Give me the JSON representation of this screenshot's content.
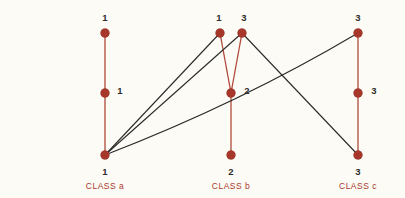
{
  "diagram": {
    "background_color": "#fdfbf5",
    "node_color": "#a8372b",
    "intra_class_line_color": "#b04a3c",
    "inter_class_line_color": "#2a2a2a",
    "label_text_color": "#2c2c2c",
    "class_label_color": "#a8372b"
  },
  "rows": [
    {
      "id": "read",
      "label": "READ:",
      "y": 33
    },
    {
      "id": "execute",
      "label": "EXECUTE:",
      "y": 93
    },
    {
      "id": "write",
      "label": "WRITE:",
      "y": 155
    }
  ],
  "classes": [
    {
      "id": "a",
      "label": "CLASS  a",
      "x": 105,
      "label_x": 105,
      "label_y": 186
    },
    {
      "id": "b",
      "label": "CLASS  b",
      "x": 231,
      "label_x": 231,
      "label_y": 186
    },
    {
      "id": "c",
      "label": "CLASS  c",
      "x": 358,
      "label_x": 358,
      "label_y": 186
    }
  ],
  "nodes": [
    {
      "id": "a-read",
      "class": "a",
      "row": "read",
      "x": 105,
      "y": 33,
      "value": "1",
      "label_x": 105,
      "label_y": 17
    },
    {
      "id": "a-execute",
      "class": "a",
      "row": "execute",
      "x": 105,
      "y": 93,
      "value": "1",
      "label_x": 120,
      "label_y": 90
    },
    {
      "id": "a-write",
      "class": "a",
      "row": "write",
      "x": 105,
      "y": 155,
      "value": "1",
      "label_x": 105,
      "label_y": 171
    },
    {
      "id": "b-read-1",
      "class": "b",
      "row": "read",
      "x": 220,
      "y": 33,
      "value": "1",
      "label_x": 219,
      "label_y": 17
    },
    {
      "id": "b-read-3",
      "class": "b",
      "row": "read",
      "x": 242,
      "y": 33,
      "value": "3",
      "label_x": 244,
      "label_y": 17
    },
    {
      "id": "b-execute",
      "class": "b",
      "row": "execute",
      "x": 231,
      "y": 93,
      "value": "2",
      "label_x": 247,
      "label_y": 90
    },
    {
      "id": "b-write",
      "class": "b",
      "row": "write",
      "x": 231,
      "y": 155,
      "value": "2",
      "label_x": 231,
      "label_y": 171
    },
    {
      "id": "c-read",
      "class": "c",
      "row": "read",
      "x": 358,
      "y": 33,
      "value": "3",
      "label_x": 358,
      "label_y": 17
    },
    {
      "id": "c-execute",
      "class": "c",
      "row": "execute",
      "x": 358,
      "y": 93,
      "value": "3",
      "label_x": 374,
      "label_y": 90
    },
    {
      "id": "c-write",
      "class": "c",
      "row": "write",
      "x": 358,
      "y": 155,
      "value": "3",
      "label_x": 358,
      "label_y": 171
    }
  ],
  "intra_class_edges": [
    {
      "id": "a-read-to-execute",
      "from": "a-read",
      "to": "a-execute"
    },
    {
      "id": "a-execute-to-write",
      "from": "a-execute",
      "to": "a-write"
    },
    {
      "id": "b-read1-to-execute",
      "from": "b-read-1",
      "to": "b-execute"
    },
    {
      "id": "b-read3-to-execute",
      "from": "b-read-3",
      "to": "b-execute"
    },
    {
      "id": "b-execute-to-write",
      "from": "b-execute",
      "to": "b-write"
    },
    {
      "id": "c-read-to-execute",
      "from": "c-read",
      "to": "c-execute"
    },
    {
      "id": "c-execute-to-write",
      "from": "c-execute",
      "to": "c-write"
    }
  ],
  "inter_class_edges": [
    {
      "id": "a-write-to-b-read1",
      "from": "a-write",
      "to": "b-read-1",
      "shape": "line"
    },
    {
      "id": "a-write-to-b-read3",
      "from": "a-write",
      "to": "b-read-3",
      "shape": "line"
    },
    {
      "id": "a-write-to-c-read",
      "from": "a-write",
      "to": "c-read",
      "shape": "curve",
      "control_x": 240,
      "control_y": 103
    },
    {
      "id": "b-read3-to-c-write",
      "from": "b-read-3",
      "to": "c-write",
      "shape": "line"
    }
  ]
}
